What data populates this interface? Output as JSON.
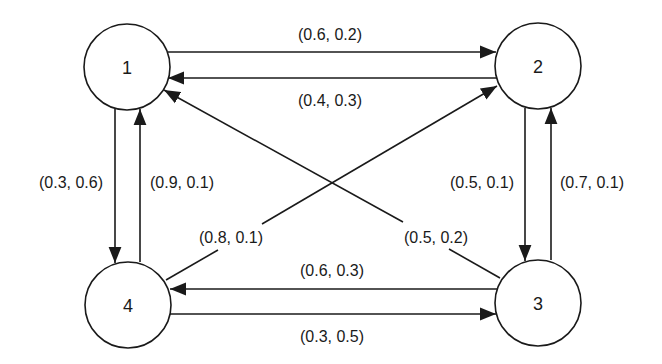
{
  "diagram": {
    "type": "directed-graph",
    "colors": {
      "stroke": "#1a1a1a",
      "background": "#ffffff"
    },
    "nodes": [
      {
        "id": "1",
        "label": "1",
        "cx": 127,
        "cy": 67,
        "r": 43
      },
      {
        "id": "2",
        "label": "2",
        "cx": 538,
        "cy": 66,
        "r": 43
      },
      {
        "id": "3",
        "label": "3",
        "cx": 538,
        "cy": 303,
        "r": 43
      },
      {
        "id": "4",
        "label": "4",
        "cx": 128,
        "cy": 305,
        "r": 43
      }
    ],
    "edges": [
      {
        "from": "1",
        "to": "2",
        "label": "(0.6, 0.2)"
      },
      {
        "from": "2",
        "to": "1",
        "label": "(0.4, 0.3)"
      },
      {
        "from": "1",
        "to": "4",
        "label": "(0.3, 0.6)"
      },
      {
        "from": "4",
        "to": "1",
        "label": "(0.9, 0.1)"
      },
      {
        "from": "2",
        "to": "3",
        "label": "(0.5, 0.1)"
      },
      {
        "from": "3",
        "to": "2",
        "label": "(0.7, 0.1)"
      },
      {
        "from": "3",
        "to": "4",
        "label": "(0.6, 0.3)"
      },
      {
        "from": "4",
        "to": "3",
        "label": "(0.3, 0.5)"
      },
      {
        "from": "4",
        "to": "2",
        "label": "(0.8, 0.1)"
      },
      {
        "from": "3",
        "to": "1",
        "label": "(0.5, 0.2)"
      }
    ]
  }
}
